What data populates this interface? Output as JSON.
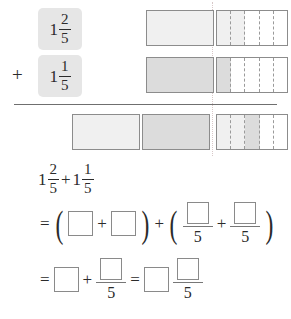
{
  "problem": {
    "addend_1": {
      "whole": "1",
      "numerator": "2",
      "denominator": "5"
    },
    "addend_2": {
      "whole": "1",
      "numerator": "1",
      "denominator": "5"
    },
    "plus_symbol": "+",
    "equals_symbol": "=",
    "paren_open": "(",
    "paren_close": ")"
  },
  "diagram": {
    "row_1": {
      "whole_bars": 1,
      "fifths_shaded": 2,
      "fifths_total": 5,
      "fill_color": "#f0f0f0"
    },
    "row_2": {
      "whole_bars": 1,
      "fifths_shaded": 1,
      "fifths_total": 5,
      "fill_color": "#dcdcdc"
    },
    "row_sum": {
      "whole_bars": 2,
      "fifths_shaded": 3,
      "fifths_total": 5
    }
  },
  "equation": {
    "line_1": {
      "term_1": {
        "whole": "1",
        "numerator": "2",
        "denominator": "5"
      },
      "operator": "+",
      "term_2": {
        "whole": "1",
        "numerator": "1",
        "denominator": "5"
      }
    },
    "line_2": {
      "equals": "=",
      "paren_open": "(",
      "blank_1": "",
      "operator_1": "+",
      "blank_2": "",
      "paren_close": ")",
      "operator_2": "+",
      "paren_open_2": "(",
      "fraction_1_denominator": "5",
      "operator_3": "+",
      "fraction_2_denominator": "5",
      "paren_close_2": ")"
    },
    "line_3": {
      "equals_1": "=",
      "blank_whole": "",
      "operator": "+",
      "fraction_denominator": "5",
      "equals_2": "=",
      "answer_whole_blank": "",
      "answer_fraction_denominator": "5"
    }
  }
}
